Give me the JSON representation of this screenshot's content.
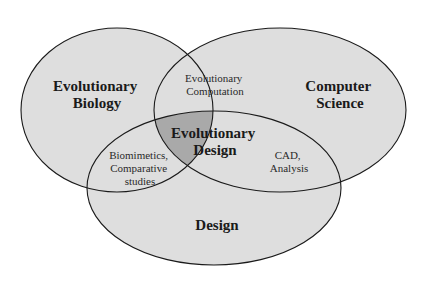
{
  "diagram": {
    "type": "venn",
    "colors": {
      "fill": "#dedede",
      "center_fill": "#a9a9a9",
      "stroke": "#1a1a1a",
      "background": "#ffffff"
    },
    "sets": [
      {
        "id": "evo-bio",
        "line1": "Evolutionary",
        "line2": "Biology"
      },
      {
        "id": "cs",
        "line1": "Computer",
        "line2": "Science"
      },
      {
        "id": "design",
        "line1": "Design"
      }
    ],
    "intersections": {
      "bio_cs": {
        "line1": "Evolutionary",
        "line2": "Computation"
      },
      "bio_design": {
        "line1": "Biomimetics,",
        "line2": "Comparative",
        "line3": "studies"
      },
      "cs_design": {
        "line1": "CAD,",
        "line2": "Analysis"
      },
      "all": {
        "line1": "Evolutionary",
        "line2": "Design"
      }
    }
  }
}
